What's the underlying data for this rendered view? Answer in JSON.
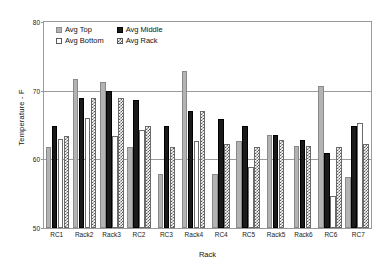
{
  "chart_data": {
    "type": "bar",
    "title": "",
    "xlabel": "Rack",
    "ylabel": "Temperature - F",
    "ylim": [
      50,
      80
    ],
    "yticks": [
      50,
      60,
      70,
      80
    ],
    "grid": true,
    "legend_position": "top-left-inside",
    "categories": [
      "RC1",
      "Rack2",
      "Rack3",
      "RC2",
      "RC3",
      "Rack4",
      "RC4",
      "RC5",
      "Rack5",
      "Rack6",
      "RC6",
      "RC7"
    ],
    "series": [
      {
        "name": "Avg Top",
        "style": "gray-fill",
        "values": [
          61.8,
          71.7,
          71.3,
          61.8,
          57.9,
          72.9,
          57.9,
          62.7,
          63.6,
          62.0,
          70.7,
          57.4
        ]
      },
      {
        "name": "Avg Middle",
        "style": "solid-black",
        "values": [
          64.8,
          69.0,
          69.9,
          68.6,
          64.8,
          67.0,
          65.9,
          64.8,
          63.5,
          62.8,
          60.9,
          64.8
        ]
      },
      {
        "name": "Avg Bottom",
        "style": "white-fill",
        "values": [
          63.0,
          66.0,
          63.4,
          64.3,
          50.0,
          62.7,
          50.0,
          58.9,
          50.0,
          50.0,
          54.7,
          65.3
        ]
      },
      {
        "name": "Avg Rack",
        "style": "checkered",
        "values": [
          63.4,
          69.0,
          69.0,
          64.9,
          61.8,
          67.0,
          62.2,
          61.8,
          62.8,
          62.0,
          61.8,
          62.3
        ]
      }
    ]
  },
  "legend": {
    "entries": [
      {
        "label": "Avg Top"
      },
      {
        "label": "Avg Middle"
      },
      {
        "label": "Avg Bottom"
      },
      {
        "label": "Avg Rack"
      }
    ]
  },
  "axes": {
    "y_title": "Temperature - F",
    "x_title": "Rack",
    "y_tick_labels": [
      "80",
      "70",
      "60",
      "50"
    ]
  }
}
